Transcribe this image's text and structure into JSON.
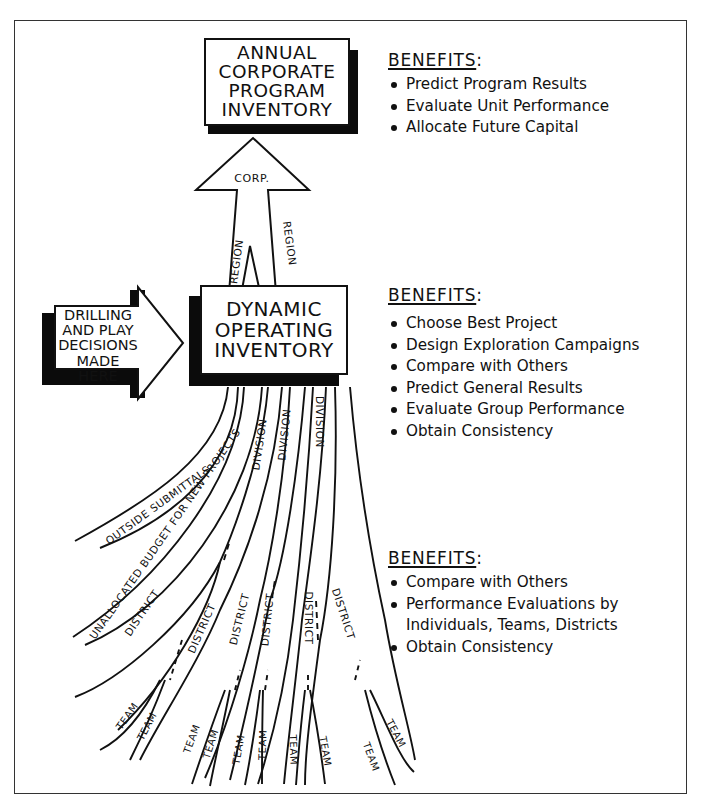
{
  "diagram": {
    "top_box": {
      "lines": [
        "ANNUAL",
        "CORPORATE",
        "PROGRAM",
        "INVENTORY"
      ]
    },
    "upward_arrow": {
      "tip_label": "CORP.",
      "left_shaft_label": "REGION",
      "right_shaft_label": "REGION"
    },
    "middle_box": {
      "lines": [
        "DYNAMIC",
        "OPERATING",
        "INVENTORY"
      ]
    },
    "input_arrow": {
      "lines": [
        "DRILLING",
        "AND PLAY",
        "DECISIONS",
        "MADE HERE"
      ]
    },
    "streams": {
      "outside": "OUTSIDE SUBMITTALS",
      "unallocated": "UNALLOCATED BUDGET FOR NEW PROJECTS",
      "divisions": [
        "DIVISION",
        "DIVISION",
        "DIVISION"
      ],
      "districts": [
        "DISTRICT",
        "DISTRICT",
        "DISTRICT",
        "DISTRICT",
        "DISTRICT",
        "DISTRICT"
      ],
      "teams": [
        "TEAM",
        "TEAM",
        "TEAM",
        "TEAM",
        "TEAM",
        "TEAM",
        "TEAM",
        "TEAM",
        "TEAM",
        "TEAM",
        "TEAM",
        "TEAM"
      ]
    }
  },
  "benefits": [
    {
      "heading": "BENEFITS",
      "items": [
        "Predict Program Results",
        "Evaluate Unit Performance",
        "Allocate Future Capital"
      ]
    },
    {
      "heading": "BENEFITS",
      "items": [
        "Choose Best Project",
        "Design Exploration Campaigns",
        "Compare with Others",
        "Predict General Results",
        "Evaluate Group Performance",
        "Obtain Consistency"
      ]
    },
    {
      "heading": "BENEFITS",
      "items": [
        "Compare with Others",
        "Performance Evaluations by",
        "Individuals, Teams, Districts",
        "Obtain Consistency"
      ]
    }
  ]
}
